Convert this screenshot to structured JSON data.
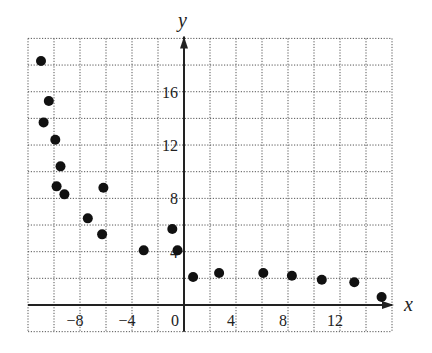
{
  "chart_data": {
    "type": "scatter",
    "title": "",
    "xlabel": "x",
    "ylabel": "y",
    "xlim": [
      -12,
      16
    ],
    "ylim": [
      -2,
      20
    ],
    "grid": true,
    "grid_step": 2,
    "grid_style": "dotted",
    "legend": null,
    "x_ticks": [
      -8,
      -4,
      0,
      4,
      8,
      12
    ],
    "x_tick_labels": [
      "−8",
      "−4",
      "0",
      "4",
      "8",
      "12"
    ],
    "y_ticks": [
      4,
      8,
      12,
      16
    ],
    "y_tick_labels": [
      "4",
      "8",
      "12",
      "16"
    ],
    "marker_color": "#111111",
    "points": [
      {
        "x": -11.0,
        "y": 18.3
      },
      {
        "x": -10.4,
        "y": 15.3
      },
      {
        "x": -10.8,
        "y": 13.7
      },
      {
        "x": -9.9,
        "y": 12.4
      },
      {
        "x": -9.5,
        "y": 10.4
      },
      {
        "x": -9.8,
        "y": 8.9
      },
      {
        "x": -9.2,
        "y": 8.3
      },
      {
        "x": -6.2,
        "y": 8.8
      },
      {
        "x": -7.4,
        "y": 6.5
      },
      {
        "x": -6.3,
        "y": 5.3
      },
      {
        "x": -3.1,
        "y": 4.1
      },
      {
        "x": -0.9,
        "y": 5.7
      },
      {
        "x": -0.5,
        "y": 4.1
      },
      {
        "x": 0.7,
        "y": 2.1
      },
      {
        "x": 2.7,
        "y": 2.4
      },
      {
        "x": 6.1,
        "y": 2.4
      },
      {
        "x": 8.3,
        "y": 2.2
      },
      {
        "x": 10.6,
        "y": 1.9
      },
      {
        "x": 13.1,
        "y": 1.7
      },
      {
        "x": 15.2,
        "y": 0.6
      }
    ]
  }
}
